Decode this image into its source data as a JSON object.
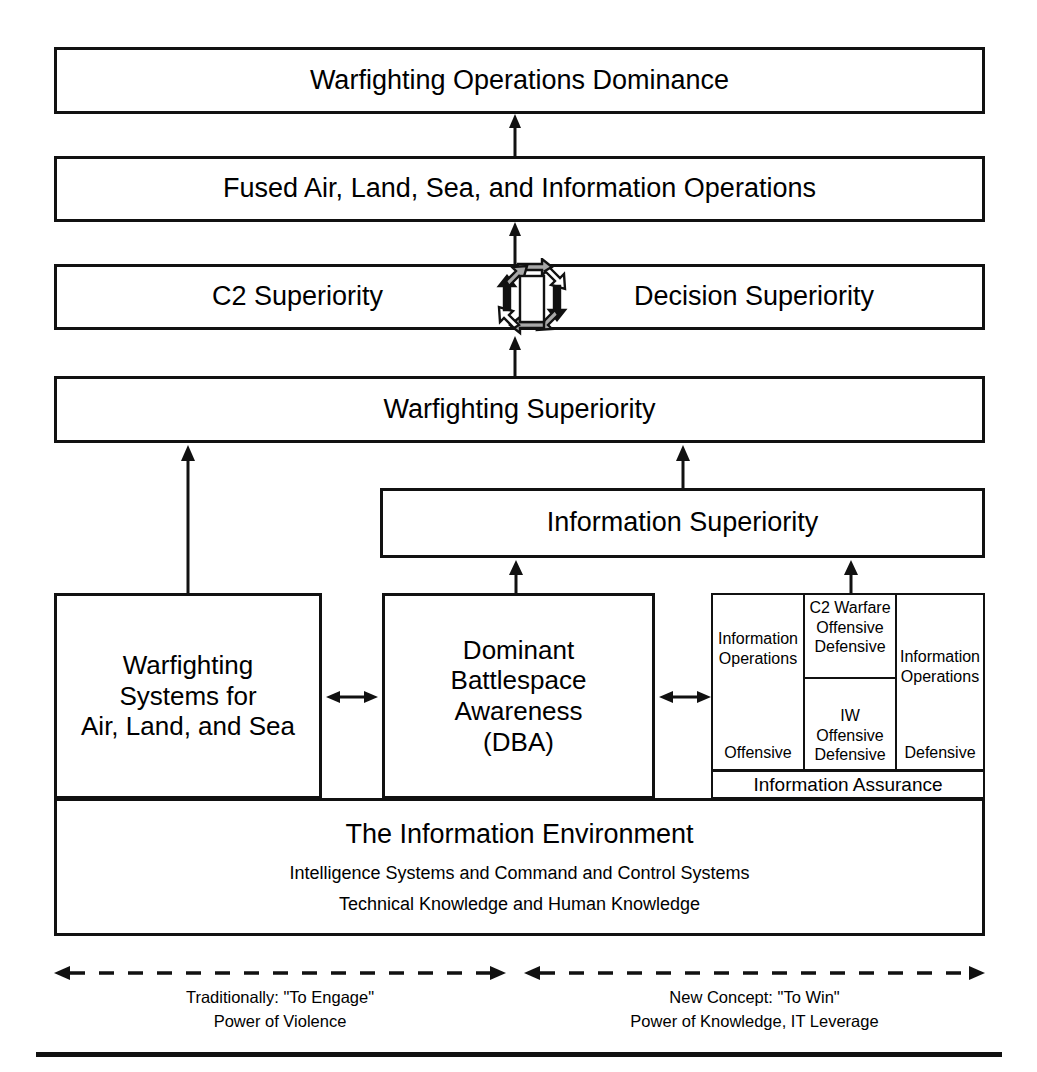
{
  "diagram": {
    "title_internal": "Warfighting and Information Superiority Framework",
    "levels": {
      "level1": "Warfighting Operations Dominance",
      "level2": "Fused Air, Land, Sea, and Information Operations",
      "level3_left": "C2 Superiority",
      "level3_right": "Decision Superiority",
      "level4": "Warfighting Superiority",
      "level5": "Information Superiority"
    },
    "pillars": {
      "warfighting_systems": [
        "Warfighting",
        "Systems for",
        "Air, Land, and Sea"
      ],
      "dba": [
        "Dominant",
        "Battlespace",
        "Awareness",
        "(DBA)"
      ],
      "info_ops_left": {
        "line1": "Information",
        "line2": "Operations",
        "line3": "Offensive"
      },
      "c2_warfare": {
        "line1": "C2 Warfare",
        "line2": "Offensive",
        "line3": "Defensive"
      },
      "iw": {
        "line1": "IW",
        "line2": "Offensive",
        "line3": "Defensive"
      },
      "info_ops_right": {
        "line1": "Information",
        "line2": "Operations",
        "line3": "Defensive"
      },
      "information_assurance": "Information Assurance"
    },
    "foundation": {
      "title": "The Information Environment",
      "line1": "Intelligence Systems and Command and Control Systems",
      "line2": "Technical Knowledge and Human Knowledge"
    },
    "footer": {
      "left": {
        "line1": "Traditionally: \"To Engage\"",
        "line2": "Power of Violence"
      },
      "right": {
        "line1": "New Concept: \"To Win\"",
        "line2": "Power of Knowledge, IT Leverage"
      }
    },
    "colors": {
      "stroke": "#111111",
      "background": "#ffffff",
      "cycle_gray": "#a8a8a8",
      "cycle_black": "#111111",
      "cycle_white": "#ffffff"
    },
    "icons": {
      "cycle": "circular-feedback-arrows-icon",
      "up_arrow": "up-arrow-icon",
      "double_arrow": "double-headed-arrow-icon",
      "dashed_span": "dashed-span-arrow-icon"
    }
  }
}
